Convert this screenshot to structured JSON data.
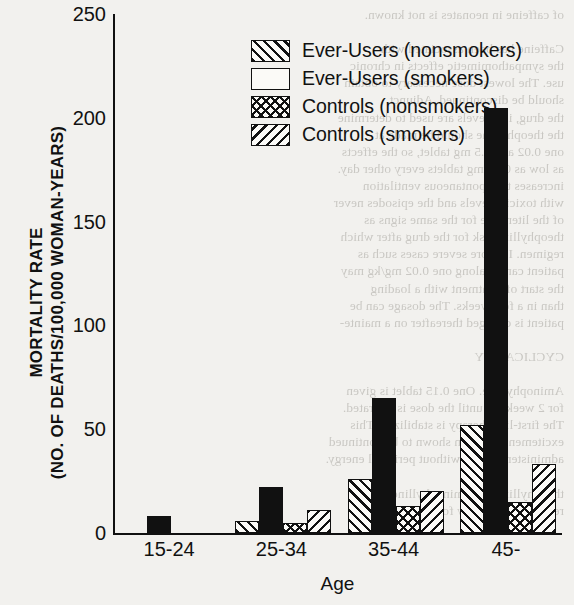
{
  "chart_data": {
    "type": "bar",
    "title": "",
    "xlabel": "Age",
    "ylabel": "MORTALITY RATE (NO. OF DEATHS/100,000 WOMAN-YEARS)",
    "ylabel_line1": "MORTALITY RATE",
    "ylabel_line2": "(NO. OF DEATHS/100,000 WOMAN-YEARS)",
    "categories": [
      "15-24",
      "25-34",
      "35-44",
      "45-"
    ],
    "ylim": [
      0,
      250
    ],
    "yticks": [
      0,
      50,
      100,
      150,
      200,
      250
    ],
    "grid": false,
    "legend_position": "top-left-inside",
    "series": [
      {
        "name": "Ever-Users (nonsmokers)",
        "pattern": "forward-hatch",
        "values": [
          0,
          6,
          26,
          52
        ]
      },
      {
        "name": "Ever-Users (smokers)",
        "pattern": "solid-black",
        "values": [
          8,
          22,
          65,
          204
        ]
      },
      {
        "name": "Controls (nonsmokers)",
        "pattern": "crosshatch",
        "values": [
          0,
          5,
          13,
          15
        ]
      },
      {
        "name": "Controls (smokers)",
        "pattern": "backward-hatch",
        "values": [
          0,
          11,
          20,
          33
        ]
      }
    ]
  },
  "ghost_text": "of caffeine in neonates is not known.\n\nCaffeine has been associated with\nthe sympathomimetic effects in chronic\nuse. The lowest dose necessary to obtain\nshould be discontinued. Adjunct\nthe drug, i.e., levels are used to determine\nthe theophylline should be made at\none 0.02 and 0.5 mg tablet, so the effects\nas low as 0.02 mg tablets every other day.\nincreases the spontaneous ventilation\nwith toxicity levels and the episodes never\nof the literature for the same signs as\ntheophylline risk for the drug after which\nregimen. In more severe cases such as\npatient can be along one 0.02 mg/kg may\nthe start of treatment with a loading\nthan in a few weeks. The dosage can be\npatient is changed thereafter on a mainte-\n\nCYCLICALITY\n\nAminophylline. One 0.15 tablet is given\nfor 2 weeks or until the dose is tolerated.\nThe first-line therapy is stabilized. This\nexcitement has been shown to be continued\nadministered daily without perinatal energy.\n\ntheophylline and aminophylline are the\nrecommended daily for patients."
}
